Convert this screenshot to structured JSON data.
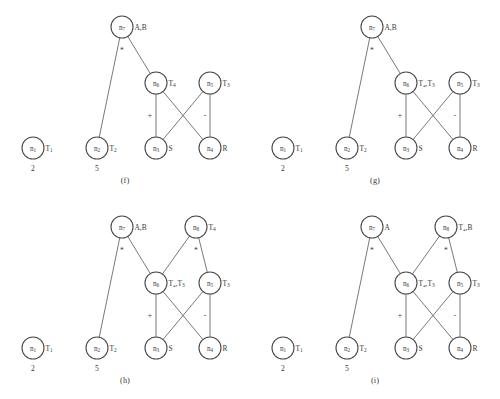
{
  "figure": {
    "node_radius": 11,
    "colors": {
      "background": "#ffffff",
      "node_stroke": "#4a4a4a",
      "edge_stroke": "#6a6a6a",
      "text": "#3a3a3a"
    },
    "panels": [
      {
        "id": "panel-f",
        "caption": "(f)",
        "x": 0,
        "y": 0,
        "caption_y": 176,
        "nodes": [
          {
            "name": "n1",
            "label": "n",
            "sub": "1",
            "cx": 33,
            "cy": 148,
            "side": "T",
            "side_sub": "1",
            "const": "2"
          },
          {
            "name": "n2",
            "label": "n",
            "sub": "2",
            "cx": 97,
            "cy": 148,
            "side": "T",
            "side_sub": "2",
            "const": "5"
          },
          {
            "name": "n3",
            "label": "n",
            "sub": "3",
            "cx": 156,
            "cy": 148,
            "side": "S",
            "side_sub": "",
            "const": ""
          },
          {
            "name": "n4",
            "label": "n",
            "sub": "4",
            "cx": 210,
            "cy": 148,
            "side": "R",
            "side_sub": "",
            "const": ""
          },
          {
            "name": "n6",
            "label": "n",
            "sub": "6",
            "cx": 156,
            "cy": 83,
            "side": "T",
            "side_sub": "4",
            "const": ""
          },
          {
            "name": "n5",
            "label": "n",
            "sub": "5",
            "cx": 210,
            "cy": 83,
            "side": "T",
            "side_sub": "3",
            "const": ""
          },
          {
            "name": "n7",
            "label": "n",
            "sub": "7",
            "cx": 122,
            "cy": 27,
            "side": "A,B",
            "side_sub": "",
            "const": ""
          }
        ],
        "edges": [
          {
            "from": "n7",
            "to": "n2"
          },
          {
            "from": "n7",
            "to": "n6"
          },
          {
            "from": "n6",
            "to": "n3"
          },
          {
            "from": "n6",
            "to": "n4"
          },
          {
            "from": "n5",
            "to": "n3"
          },
          {
            "from": "n5",
            "to": "n4"
          }
        ],
        "op_labels": [
          {
            "text": "*",
            "x": 122,
            "y": 53
          },
          {
            "text": "+",
            "x": 150,
            "y": 118
          },
          {
            "text": "-",
            "x": 205,
            "y": 118
          }
        ]
      },
      {
        "id": "panel-g",
        "caption": "(g)",
        "x": 250,
        "y": 0,
        "caption_y": 176,
        "nodes": [
          {
            "name": "n1",
            "label": "n",
            "sub": "1",
            "cx": 33,
            "cy": 148,
            "side": "T",
            "side_sub": "1",
            "const": "2"
          },
          {
            "name": "n2",
            "label": "n",
            "sub": "2",
            "cx": 97,
            "cy": 148,
            "side": "T",
            "side_sub": "2",
            "const": "5"
          },
          {
            "name": "n3",
            "label": "n",
            "sub": "3",
            "cx": 156,
            "cy": 148,
            "side": "S",
            "side_sub": "",
            "const": ""
          },
          {
            "name": "n4",
            "label": "n",
            "sub": "4",
            "cx": 210,
            "cy": 148,
            "side": "R",
            "side_sub": "",
            "const": ""
          },
          {
            "name": "n6",
            "label": "n",
            "sub": "6",
            "cx": 156,
            "cy": 83,
            "side": "T₄,T",
            "side_sub": "3",
            "const": ""
          },
          {
            "name": "n5",
            "label": "n",
            "sub": "5",
            "cx": 210,
            "cy": 83,
            "side": "T",
            "side_sub": "3",
            "const": ""
          },
          {
            "name": "n7",
            "label": "n",
            "sub": "7",
            "cx": 122,
            "cy": 27,
            "side": "A,B",
            "side_sub": "",
            "const": ""
          }
        ],
        "edges": [
          {
            "from": "n7",
            "to": "n2"
          },
          {
            "from": "n7",
            "to": "n6"
          },
          {
            "from": "n6",
            "to": "n3"
          },
          {
            "from": "n6",
            "to": "n4"
          },
          {
            "from": "n5",
            "to": "n3"
          },
          {
            "from": "n5",
            "to": "n4"
          }
        ],
        "op_labels": [
          {
            "text": "*",
            "x": 122,
            "y": 53
          },
          {
            "text": "+",
            "x": 150,
            "y": 118
          },
          {
            "text": "-",
            "x": 205,
            "y": 118
          }
        ]
      },
      {
        "id": "panel-h",
        "caption": "(h)",
        "x": 0,
        "y": 200,
        "caption_y": 176,
        "nodes": [
          {
            "name": "n1",
            "label": "n",
            "sub": "1",
            "cx": 33,
            "cy": 148,
            "side": "T",
            "side_sub": "1",
            "const": "2"
          },
          {
            "name": "n2",
            "label": "n",
            "sub": "2",
            "cx": 97,
            "cy": 148,
            "side": "T",
            "side_sub": "2",
            "const": "5"
          },
          {
            "name": "n3",
            "label": "n",
            "sub": "3",
            "cx": 156,
            "cy": 148,
            "side": "S",
            "side_sub": "",
            "const": ""
          },
          {
            "name": "n4",
            "label": "n",
            "sub": "4",
            "cx": 210,
            "cy": 148,
            "side": "R",
            "side_sub": "",
            "const": ""
          },
          {
            "name": "n6",
            "label": "n",
            "sub": "6",
            "cx": 156,
            "cy": 83,
            "side": "T₄,T",
            "side_sub": "3",
            "const": ""
          },
          {
            "name": "n5",
            "label": "n",
            "sub": "5",
            "cx": 210,
            "cy": 83,
            "side": "T",
            "side_sub": "3",
            "const": ""
          },
          {
            "name": "n7",
            "label": "n",
            "sub": "7",
            "cx": 122,
            "cy": 27,
            "side": "A,B",
            "side_sub": "",
            "const": ""
          },
          {
            "name": "n8",
            "label": "n",
            "sub": "8",
            "cx": 196,
            "cy": 27,
            "side": "T",
            "side_sub": "4",
            "const": ""
          }
        ],
        "edges": [
          {
            "from": "n7",
            "to": "n2"
          },
          {
            "from": "n7",
            "to": "n6"
          },
          {
            "from": "n8",
            "to": "n6"
          },
          {
            "from": "n8",
            "to": "n5"
          },
          {
            "from": "n6",
            "to": "n3"
          },
          {
            "from": "n6",
            "to": "n4"
          },
          {
            "from": "n5",
            "to": "n3"
          },
          {
            "from": "n5",
            "to": "n4"
          }
        ],
        "op_labels": [
          {
            "text": "*",
            "x": 122,
            "y": 53
          },
          {
            "text": "*",
            "x": 196,
            "y": 53
          },
          {
            "text": "+",
            "x": 150,
            "y": 118
          },
          {
            "text": "-",
            "x": 205,
            "y": 118
          }
        ]
      },
      {
        "id": "panel-i",
        "caption": "(i)",
        "x": 250,
        "y": 200,
        "caption_y": 176,
        "nodes": [
          {
            "name": "n1",
            "label": "n",
            "sub": "1",
            "cx": 33,
            "cy": 148,
            "side": "T",
            "side_sub": "1",
            "const": "2"
          },
          {
            "name": "n2",
            "label": "n",
            "sub": "2",
            "cx": 97,
            "cy": 148,
            "side": "T",
            "side_sub": "2",
            "const": "5"
          },
          {
            "name": "n3",
            "label": "n",
            "sub": "3",
            "cx": 156,
            "cy": 148,
            "side": "S",
            "side_sub": "",
            "const": ""
          },
          {
            "name": "n4",
            "label": "n",
            "sub": "4",
            "cx": 210,
            "cy": 148,
            "side": "R",
            "side_sub": "",
            "const": ""
          },
          {
            "name": "n6",
            "label": "n",
            "sub": "6",
            "cx": 156,
            "cy": 83,
            "side": "T₄,T",
            "side_sub": "3",
            "const": ""
          },
          {
            "name": "n5",
            "label": "n",
            "sub": "5",
            "cx": 210,
            "cy": 83,
            "side": "T",
            "side_sub": "3",
            "const": ""
          },
          {
            "name": "n7",
            "label": "n",
            "sub": "7",
            "cx": 122,
            "cy": 27,
            "side": "A",
            "side_sub": "",
            "const": ""
          },
          {
            "name": "n8",
            "label": "n",
            "sub": "8",
            "cx": 196,
            "cy": 27,
            "side": "T₄,B",
            "side_sub": "",
            "const": ""
          }
        ],
        "edges": [
          {
            "from": "n7",
            "to": "n2"
          },
          {
            "from": "n7",
            "to": "n6"
          },
          {
            "from": "n8",
            "to": "n6"
          },
          {
            "from": "n8",
            "to": "n5"
          },
          {
            "from": "n6",
            "to": "n3"
          },
          {
            "from": "n6",
            "to": "n4"
          },
          {
            "from": "n5",
            "to": "n3"
          },
          {
            "from": "n5",
            "to": "n4"
          }
        ],
        "op_labels": [
          {
            "text": "*",
            "x": 122,
            "y": 53
          },
          {
            "text": "*",
            "x": 196,
            "y": 53
          },
          {
            "text": "+",
            "x": 150,
            "y": 118
          },
          {
            "text": "-",
            "x": 205,
            "y": 118
          }
        ]
      }
    ]
  }
}
